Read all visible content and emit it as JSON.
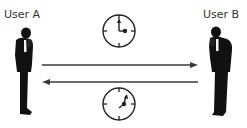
{
  "diagram": {
    "nodes": [
      {
        "id": "user-a",
        "label": "User A",
        "icon": "person-on-phone-icon"
      },
      {
        "id": "user-b",
        "label": "User B",
        "icon": "person-on-phone-icon"
      }
    ],
    "edges": [
      {
        "from": "user-a",
        "to": "user-b",
        "direction": "right",
        "icon": "clock-icon",
        "clock_position": "above"
      },
      {
        "from": "user-b",
        "to": "user-a",
        "direction": "left",
        "icon": "clock-icon",
        "clock_position": "below"
      }
    ],
    "colors": {
      "line": "#3a3a3a",
      "figure": "#111111",
      "text": "#333333",
      "background": "#ffffff"
    }
  }
}
